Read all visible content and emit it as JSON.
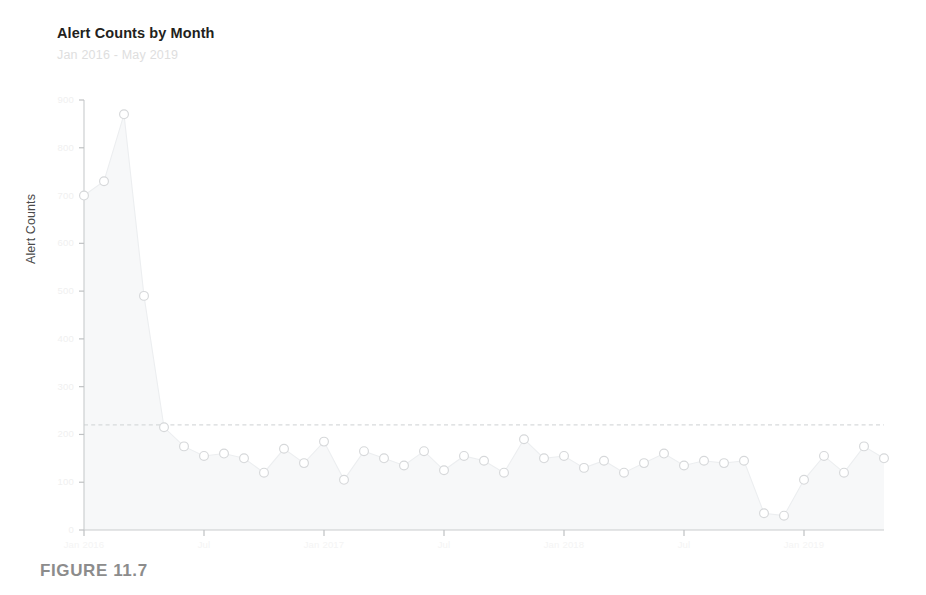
{
  "figure": {
    "caption": "FIGURE 11.7"
  },
  "chart_data": {
    "type": "line",
    "title": "Alert Counts by Month",
    "subtitle": "Jan 2016 - May 2019",
    "xlabel": "",
    "ylabel": "Alert Counts",
    "ylim": [
      0,
      900
    ],
    "xlim": [
      0,
      40
    ],
    "grid": false,
    "legend": null,
    "marker": "open-circle",
    "fill": "area-below-line",
    "y_ticks": [
      0,
      100,
      200,
      300,
      400,
      500,
      600,
      700,
      800,
      900
    ],
    "y_tick_labels": [
      "0",
      "100",
      "200",
      "300",
      "400",
      "500",
      "600",
      "700",
      "800",
      "900"
    ],
    "x_ticks": [
      0,
      6,
      12,
      18,
      24,
      30,
      36
    ],
    "x_tick_labels": [
      "Jan 2016",
      "Jul",
      "Jan 2017",
      "Jul",
      "Jan 2018",
      "Jul",
      "Jan 2019"
    ],
    "threshold": {
      "value": 220,
      "style": "dashed",
      "label": ""
    },
    "categories": [
      "Jan 2016",
      "Feb 2016",
      "Mar 2016",
      "Apr 2016",
      "May 2016",
      "Jun 2016",
      "Jul 2016",
      "Aug 2016",
      "Sep 2016",
      "Oct 2016",
      "Nov 2016",
      "Dec 2016",
      "Jan 2017",
      "Feb 2017",
      "Mar 2017",
      "Apr 2017",
      "May 2017",
      "Jun 2017",
      "Jul 2017",
      "Aug 2017",
      "Sep 2017",
      "Oct 2017",
      "Nov 2017",
      "Dec 2017",
      "Jan 2018",
      "Feb 2018",
      "Mar 2018",
      "Apr 2018",
      "May 2018",
      "Jun 2018",
      "Jul 2018",
      "Aug 2018",
      "Sep 2018",
      "Oct 2018",
      "Nov 2018",
      "Dec 2018",
      "Jan 2019",
      "Feb 2019",
      "Mar 2019",
      "Apr 2019",
      "May 2019"
    ],
    "values": [
      700,
      730,
      870,
      490,
      215,
      175,
      155,
      160,
      150,
      120,
      170,
      140,
      185,
      105,
      165,
      150,
      135,
      165,
      125,
      155,
      145,
      120,
      190,
      150,
      155,
      130,
      145,
      120,
      140,
      160,
      135,
      145,
      140,
      145,
      35,
      30,
      105,
      155,
      120,
      175,
      150
    ]
  }
}
